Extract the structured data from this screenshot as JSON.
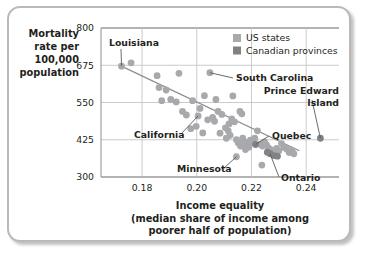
{
  "chart_data": {
    "type": "scatter",
    "title": "",
    "xlabel": "Income equality",
    "xlabel_lines": [
      "Income equality",
      "(median share of income among",
      "poorer half of population)"
    ],
    "ylabel_lines": [
      "Mortality",
      "rate per",
      "100,000",
      "population"
    ],
    "ylabel": "Mortality rate per 100,000 population",
    "xlim": [
      0.165,
      0.252
    ],
    "ylim": [
      300,
      800
    ],
    "xticks": [
      0.18,
      0.2,
      0.22,
      0.24
    ],
    "xtick_labels": [
      "0.18",
      "0.20",
      "0.22",
      "0.24"
    ],
    "yticks": [
      300,
      425,
      550,
      675,
      800
    ],
    "ytick_labels": [
      "300",
      "425",
      "550",
      "675",
      "800"
    ],
    "grid": true,
    "legend_position": "top-right",
    "legend": [
      {
        "name": "US states",
        "color": "#a7a9ac"
      },
      {
        "name": "Canadian provinces",
        "color": "#808285"
      }
    ],
    "trendline": {
      "x": [
        0.1715,
        0.2375
      ],
      "y": [
        676,
        388
      ],
      "color": "#8d8d8d"
    },
    "annotations": [
      {
        "label": "Louisiana",
        "x": 0.1725,
        "y": 672
      },
      {
        "label": "South Carolina",
        "x": 0.2048,
        "y": 650
      },
      {
        "label": "Prince Edward Island",
        "x": 0.2452,
        "y": 430
      },
      {
        "label": "California",
        "x": 0.2005,
        "y": 505
      },
      {
        "label": "Quebec",
        "x": 0.2215,
        "y": 409
      },
      {
        "label": "Minnesota",
        "x": 0.2145,
        "y": 368
      },
      {
        "label": "Ontario",
        "x": 0.2268,
        "y": 378
      }
    ],
    "series": [
      {
        "name": "US states",
        "color": "#a7a9ac",
        "points": [
          [
            0.1725,
            672
          ],
          [
            0.176,
            683
          ],
          [
            0.1855,
            640
          ],
          [
            0.1862,
            600
          ],
          [
            0.1888,
            592
          ],
          [
            0.1905,
            560
          ],
          [
            0.1872,
            556
          ],
          [
            0.1935,
            648
          ],
          [
            0.1925,
            552
          ],
          [
            0.1948,
            520
          ],
          [
            0.1962,
            508
          ],
          [
            0.1985,
            556
          ],
          [
            0.2005,
            505
          ],
          [
            0.2012,
            530
          ],
          [
            0.2028,
            573
          ],
          [
            0.2048,
            650
          ],
          [
            0.2058,
            500
          ],
          [
            0.204,
            492
          ],
          [
            0.2065,
            487
          ],
          [
            0.2078,
            520
          ],
          [
            0.2092,
            510
          ],
          [
            0.2105,
            465
          ],
          [
            0.2115,
            455
          ],
          [
            0.2122,
            440
          ],
          [
            0.2108,
            430
          ],
          [
            0.2085,
            447
          ],
          [
            0.2132,
            572
          ],
          [
            0.2138,
            485
          ],
          [
            0.2145,
            425
          ],
          [
            0.2152,
            414
          ],
          [
            0.216,
            404
          ],
          [
            0.2145,
            368
          ],
          [
            0.2168,
            430
          ],
          [
            0.2175,
            418
          ],
          [
            0.2182,
            410
          ],
          [
            0.219,
            400
          ],
          [
            0.2178,
            392
          ],
          [
            0.2196,
            424
          ],
          [
            0.2205,
            415
          ],
          [
            0.2212,
            430
          ],
          [
            0.2158,
            520
          ],
          [
            0.2165,
            512
          ],
          [
            0.2222,
            455
          ],
          [
            0.2232,
            410
          ],
          [
            0.224,
            404
          ],
          [
            0.2238,
            340
          ],
          [
            0.2248,
            418
          ],
          [
            0.2255,
            408
          ],
          [
            0.2262,
            398
          ],
          [
            0.227,
            392
          ],
          [
            0.2278,
            385
          ],
          [
            0.2285,
            380
          ],
          [
            0.2292,
            396
          ],
          [
            0.23,
            388
          ],
          [
            0.231,
            412
          ],
          [
            0.2318,
            400
          ],
          [
            0.2328,
            394
          ],
          [
            0.2338,
            382
          ],
          [
            0.2348,
            390
          ],
          [
            0.2355,
            378
          ],
          [
            0.1978,
            462
          ],
          [
            0.2022,
            448
          ],
          [
            0.1998,
            470
          ],
          [
            0.207,
            560
          ],
          [
            0.2128,
            495
          ],
          [
            0.2118,
            478
          ]
        ]
      },
      {
        "name": "Canadian provinces",
        "color": "#808285",
        "points": [
          [
            0.2452,
            430
          ],
          [
            0.2215,
            409
          ],
          [
            0.2268,
            378
          ],
          [
            0.2282,
            372
          ],
          [
            0.2295,
            370
          ],
          [
            0.2258,
            383
          ]
        ]
      }
    ]
  }
}
